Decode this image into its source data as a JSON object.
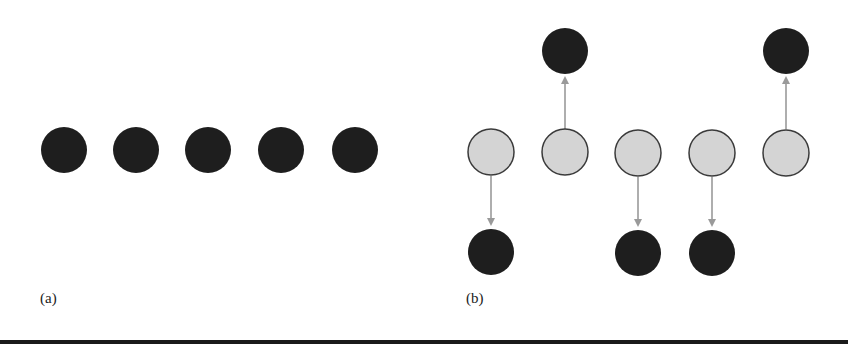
{
  "panels": [
    {
      "label": "(a)",
      "nodes": [
        {
          "x": 64,
          "y": 150,
          "type": "dark"
        },
        {
          "x": 136,
          "y": 150,
          "type": "dark"
        },
        {
          "x": 208,
          "y": 150,
          "type": "dark"
        },
        {
          "x": 281,
          "y": 150,
          "type": "dark"
        },
        {
          "x": 355,
          "y": 150,
          "type": "dark"
        }
      ]
    },
    {
      "label": "(b)",
      "nodes": [
        {
          "x": 491,
          "y": 152,
          "type": "light"
        },
        {
          "x": 565,
          "y": 152,
          "type": "light"
        },
        {
          "x": 638,
          "y": 153,
          "type": "light"
        },
        {
          "x": 712,
          "y": 153,
          "type": "light"
        },
        {
          "x": 786,
          "y": 153,
          "type": "light"
        },
        {
          "x": 565,
          "y": 51,
          "type": "dark"
        },
        {
          "x": 786,
          "y": 51,
          "type": "dark"
        },
        {
          "x": 491,
          "y": 252,
          "type": "dark"
        },
        {
          "x": 638,
          "y": 253,
          "type": "dark"
        },
        {
          "x": 712,
          "y": 253,
          "type": "dark"
        }
      ],
      "arrows": [
        {
          "x": 491,
          "from": 176,
          "to": 226,
          "dir": "down"
        },
        {
          "x": 565,
          "from": 129,
          "to": 76,
          "dir": "up"
        },
        {
          "x": 638,
          "from": 177,
          "to": 227,
          "dir": "down"
        },
        {
          "x": 712,
          "from": 177,
          "to": 227,
          "dir": "down"
        },
        {
          "x": 786,
          "from": 129,
          "to": 76,
          "dir": "up"
        }
      ]
    }
  ],
  "colors": {
    "dark": "#1e1e1e",
    "light": "#d4d4d4",
    "stroke": "#3a3a3a",
    "arrow": "#9a9a9a"
  },
  "radius": 23
}
